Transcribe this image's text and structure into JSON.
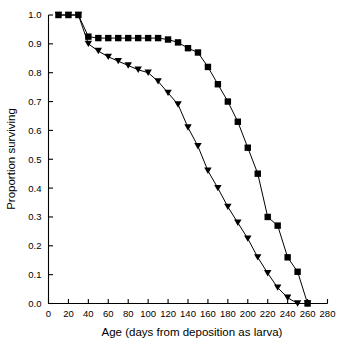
{
  "chart_data": {
    "type": "line",
    "title": "",
    "xlabel": "Age (days from deposition as larva)",
    "ylabel": "Proportion surviving",
    "xlim": [
      0,
      280
    ],
    "ylim": [
      0,
      1.0
    ],
    "grid": false,
    "legend": "none",
    "xticks": [
      0,
      20,
      40,
      60,
      80,
      100,
      120,
      140,
      160,
      180,
      200,
      220,
      240,
      260,
      280
    ],
    "xtick_labels": [
      "0",
      "20",
      "40",
      "60",
      "80",
      "100",
      "120",
      "140",
      "160",
      "180",
      "200",
      "220",
      "240",
      "260",
      "280"
    ],
    "yticks": [
      0.0,
      0.1,
      0.2,
      0.3,
      0.4,
      0.5,
      0.6,
      0.7,
      0.8,
      0.9,
      1.0
    ],
    "ytick_labels": [
      "0.0",
      "0.1",
      "0.2",
      "0.3",
      "0.4",
      "0.5",
      "0.6",
      "0.7",
      "0.8",
      "0.9",
      "1.0"
    ],
    "series": [
      {
        "name": "square-series",
        "marker": "square",
        "color": "#000000",
        "x": [
          10,
          20,
          30,
          40,
          50,
          60,
          70,
          80,
          90,
          100,
          110,
          120,
          130,
          140,
          150,
          160,
          170,
          180,
          190,
          200,
          210,
          220,
          230,
          240,
          250,
          260
        ],
        "y": [
          1.0,
          1.0,
          1.0,
          0.925,
          0.92,
          0.92,
          0.92,
          0.92,
          0.92,
          0.92,
          0.92,
          0.915,
          0.905,
          0.885,
          0.87,
          0.82,
          0.76,
          0.7,
          0.63,
          0.54,
          0.45,
          0.3,
          0.27,
          0.16,
          0.11,
          0.0
        ]
      },
      {
        "name": "triangle-series",
        "marker": "triangle-down",
        "color": "#000000",
        "x": [
          10,
          20,
          30,
          40,
          50,
          60,
          70,
          80,
          90,
          100,
          110,
          120,
          130,
          140,
          150,
          160,
          170,
          180,
          190,
          200,
          210,
          220,
          230,
          240,
          250,
          260
        ],
        "y": [
          1.0,
          1.0,
          1.0,
          0.9,
          0.875,
          0.855,
          0.84,
          0.825,
          0.81,
          0.8,
          0.77,
          0.73,
          0.69,
          0.61,
          0.545,
          0.46,
          0.4,
          0.335,
          0.28,
          0.225,
          0.16,
          0.105,
          0.055,
          0.02,
          0.0,
          0.0
        ]
      }
    ]
  }
}
